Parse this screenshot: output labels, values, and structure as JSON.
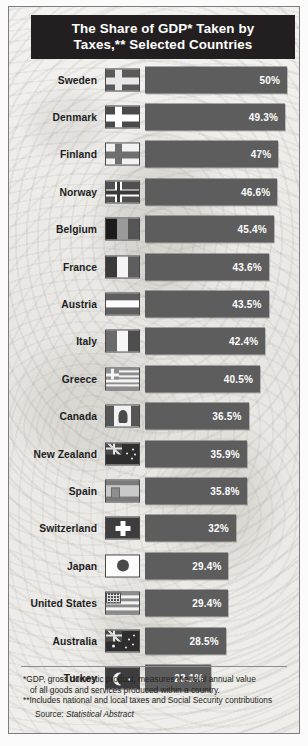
{
  "header": {
    "title_line1": "The Share of GDP* Taken by",
    "title_line2": "Taxes,** Selected Countries",
    "title_bg": "#231f20",
    "title_color": "#ffffff"
  },
  "style": {
    "bar_color": "#5d5d5d",
    "bar_label_color": "#ffffff",
    "panel_bg": "#e9e9e6",
    "text_color": "#231f20"
  },
  "chart_data": {
    "type": "bar",
    "title": "The Share of GDP* Taken by Taxes,** Selected Countries",
    "xlabel": "",
    "ylabel": "",
    "orientation": "horizontal",
    "value_suffix": "%",
    "xlim": [
      0,
      50
    ],
    "grid": false,
    "legend": "none",
    "categories": [
      "Sweden",
      "Denmark",
      "Finland",
      "Norway",
      "Belgium",
      "France",
      "Austria",
      "Italy",
      "Greece",
      "Canada",
      "New Zealand",
      "Spain",
      "Switzerland",
      "Japan",
      "United States",
      "Australia",
      "Turkey"
    ],
    "values": [
      50,
      49.3,
      47,
      46.6,
      45.4,
      43.6,
      43.5,
      42.4,
      40.5,
      36.5,
      35.9,
      35.8,
      32,
      29.4,
      29.4,
      28.5,
      23.1
    ],
    "labels": [
      "50%",
      "49.3%",
      "47%",
      "46.6%",
      "45.4%",
      "43.6%",
      "43.5%",
      "42.4%",
      "40.5%",
      "36.5%",
      "35.9%",
      "35.8%",
      "32%",
      "29.4%",
      "29.4%",
      "28.5%",
      "23.1%"
    ],
    "rows": [
      {
        "country": "Sweden",
        "value": 50,
        "label": "50%",
        "flag": "flag-sweden"
      },
      {
        "country": "Denmark",
        "value": 49.3,
        "label": "49.3%",
        "flag": "flag-denmark"
      },
      {
        "country": "Finland",
        "value": 47,
        "label": "47%",
        "flag": "flag-finland"
      },
      {
        "country": "Norway",
        "value": 46.6,
        "label": "46.6%",
        "flag": "flag-norway"
      },
      {
        "country": "Belgium",
        "value": 45.4,
        "label": "45.4%",
        "flag": "flag-belgium"
      },
      {
        "country": "France",
        "value": 43.6,
        "label": "43.6%",
        "flag": "flag-france"
      },
      {
        "country": "Austria",
        "value": 43.5,
        "label": "43.5%",
        "flag": "flag-austria"
      },
      {
        "country": "Italy",
        "value": 42.4,
        "label": "42.4%",
        "flag": "flag-italy"
      },
      {
        "country": "Greece",
        "value": 40.5,
        "label": "40.5%",
        "flag": "flag-greece"
      },
      {
        "country": "Canada",
        "value": 36.5,
        "label": "36.5%",
        "flag": "flag-canada"
      },
      {
        "country": "New Zealand",
        "value": 35.9,
        "label": "35.9%",
        "flag": "flag-new-zealand"
      },
      {
        "country": "Spain",
        "value": 35.8,
        "label": "35.8%",
        "flag": "flag-spain"
      },
      {
        "country": "Switzerland",
        "value": 32,
        "label": "32%",
        "flag": "flag-switzerland"
      },
      {
        "country": "Japan",
        "value": 29.4,
        "label": "29.4%",
        "flag": "flag-japan"
      },
      {
        "country": "United States",
        "value": 29.4,
        "label": "29.4%",
        "flag": "flag-united-states"
      },
      {
        "country": "Australia",
        "value": 28.5,
        "label": "28.5%",
        "flag": "flag-australia"
      },
      {
        "country": "Turkey",
        "value": 23.1,
        "label": "23.1%",
        "flag": "flag-turkey"
      }
    ]
  },
  "footnotes": {
    "note1_line1": "*GDP, gross domestic product, measures the total annual value",
    "note1_line2": "of all goods and services produced within a country.",
    "note2": "**Includes national and local taxes and Social Security contributions",
    "source_prefix": "Source: ",
    "source_name": "Statistical Abstract"
  }
}
